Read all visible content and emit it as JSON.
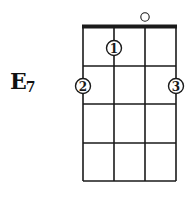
{
  "chord": {
    "root": "E",
    "quality": "7",
    "full_name": "E7"
  },
  "diagram": {
    "instrument_strings": 4,
    "frets_shown": 4,
    "nut": true,
    "open_strings": [
      3
    ],
    "fingerings": [
      {
        "finger": "1",
        "string": 2,
        "fret": 1
      },
      {
        "finger": "2",
        "string": 1,
        "fret": 2
      },
      {
        "finger": "3",
        "string": 4,
        "fret": 2
      }
    ],
    "line_color": "#1a1a1a",
    "background": "#ffffff"
  }
}
